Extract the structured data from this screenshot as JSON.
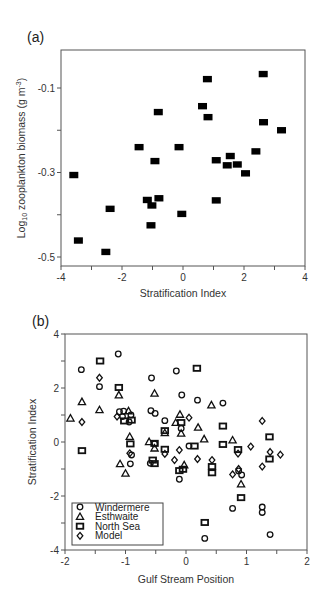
{
  "figure": {
    "panels": [
      "(a)",
      "(b)"
    ]
  },
  "chart_data": [
    {
      "panel_label": "(a)",
      "type": "scatter",
      "title": "",
      "xlabel": "Stratification Index",
      "ylabel": "Log10 zooplankton biomass (g m-3)",
      "ylabel_parts": {
        "main": "Log",
        "sub": "10",
        "rest": " zooplankton biomass (g m",
        "sup": "-3",
        "end": ")"
      },
      "xlim": [
        -4,
        4
      ],
      "ylim": [
        -0.54,
        -0.01
      ],
      "xticks": [
        -4,
        -3,
        -2,
        -1,
        0,
        1,
        2,
        3,
        4
      ],
      "xtick_labels": [
        "-4",
        "",
        "-2",
        "",
        "0",
        "",
        "2",
        "",
        "4"
      ],
      "yticks": [
        -0.5,
        -0.4,
        -0.3,
        -0.2,
        -0.1
      ],
      "ytick_labels": [
        "-0.5",
        "",
        "-0.3",
        "",
        "-0.1"
      ],
      "grid": false,
      "legend": null,
      "series": [
        {
          "name": "Zooplankton biomass",
          "marker": "filled-square",
          "color": "#000000",
          "points": [
            [
              -3.58,
              -0.306
            ],
            [
              -3.43,
              -0.461
            ],
            [
              -2.53,
              -0.488
            ],
            [
              -2.39,
              -0.386
            ],
            [
              -1.44,
              -0.24
            ],
            [
              -0.81,
              -0.157
            ],
            [
              -0.92,
              -0.273
            ],
            [
              -0.13,
              -0.24
            ],
            [
              -1.17,
              -0.365
            ],
            [
              -0.79,
              -0.361
            ],
            [
              -1.02,
              -0.378
            ],
            [
              -1.05,
              -0.425
            ],
            [
              -0.04,
              -0.398
            ],
            [
              0.8,
              -0.079
            ],
            [
              2.63,
              -0.067
            ],
            [
              0.64,
              -0.143
            ],
            [
              0.82,
              -0.169
            ],
            [
              2.64,
              -0.181
            ],
            [
              3.23,
              -0.2
            ],
            [
              2.39,
              -0.25
            ],
            [
              1.09,
              -0.271
            ],
            [
              1.55,
              -0.261
            ],
            [
              1.45,
              -0.283
            ],
            [
              1.78,
              -0.281
            ],
            [
              2.05,
              -0.302
            ],
            [
              1.09,
              -0.366
            ]
          ]
        }
      ]
    },
    {
      "panel_label": "(b)",
      "type": "scatter",
      "title": "",
      "xlabel": "Gulf Stream Position",
      "ylabel": "Stratification Index",
      "xlim": [
        -2,
        2
      ],
      "ylim": [
        -4,
        4
      ],
      "xticks": [
        -2,
        -1.5,
        -1,
        -0.5,
        0,
        0.5,
        1,
        1.5,
        2
      ],
      "xtick_labels": [
        "-2",
        "",
        "-1",
        "",
        "0",
        "",
        "1",
        "",
        "2"
      ],
      "yticks": [
        -4,
        -3,
        -2,
        -1,
        0,
        1,
        2,
        3,
        4
      ],
      "ytick_labels": [
        "-4",
        "",
        "-2",
        "",
        "0",
        "",
        "2",
        "",
        "4"
      ],
      "grid": false,
      "legend": {
        "position": "lower left",
        "entries": [
          "Windermere",
          "Esthwaite",
          "North Sea",
          "Model"
        ]
      },
      "series": [
        {
          "name": "Windermere",
          "marker": "circle",
          "points": [
            [
              -1.73,
              2.68
            ],
            [
              -1.12,
              3.26
            ],
            [
              -1.43,
              2.05
            ],
            [
              -0.57,
              2.37
            ],
            [
              -0.16,
              2.63
            ],
            [
              -0.07,
              1.74
            ],
            [
              0.19,
              1.55
            ],
            [
              0.61,
              1.44
            ],
            [
              -1.1,
              1.12
            ],
            [
              -1.03,
              1.14
            ],
            [
              -1.05,
              0.94
            ],
            [
              -0.91,
              1.0
            ],
            [
              -0.94,
              0.74
            ],
            [
              -0.51,
              1.06
            ],
            [
              -0.58,
              1.16
            ],
            [
              -0.35,
              0.79
            ],
            [
              -0.08,
              0.5
            ],
            [
              -0.92,
              -0.81
            ],
            [
              -0.59,
              -0.79
            ],
            [
              -0.52,
              -0.07
            ],
            [
              -0.11,
              -1.38
            ],
            [
              0.05,
              -0.15
            ],
            [
              0.77,
              -2.46
            ],
            [
              1.26,
              -2.41
            ],
            [
              1.26,
              -2.61
            ],
            [
              0.31,
              -3.57
            ],
            [
              1.39,
              -3.43
            ],
            [
              0.87,
              -1.07
            ],
            [
              0.92,
              -1.22
            ],
            [
              -0.9,
              -0.48
            ]
          ]
        },
        {
          "name": "Esthwaite",
          "marker": "triangle",
          "points": [
            [
              -1.91,
              0.88
            ],
            [
              -1.72,
              1.49
            ],
            [
              -1.43,
              1.19
            ],
            [
              -1.11,
              1.74
            ],
            [
              -0.95,
              1.15
            ],
            [
              -0.52,
              1.8
            ],
            [
              -0.1,
              1.02
            ],
            [
              -0.17,
              0.72
            ],
            [
              -0.35,
              0.34
            ],
            [
              -0.08,
              0.32
            ],
            [
              -0.93,
              0.2
            ],
            [
              -0.61,
              0.01
            ],
            [
              -0.52,
              -0.23
            ],
            [
              -1.09,
              -0.81
            ],
            [
              -1.0,
              -1.16
            ],
            [
              -0.03,
              -0.85
            ],
            [
              0.2,
              0.54
            ],
            [
              0.3,
              0.11
            ],
            [
              0.42,
              1.37
            ],
            [
              0.77,
              0.07
            ],
            [
              0.91,
              -1.56
            ]
          ]
        },
        {
          "name": "North Sea",
          "marker": "square",
          "points": [
            [
              -1.42,
              3.0
            ],
            [
              -1.11,
              2.02
            ],
            [
              -1.02,
              0.78
            ],
            [
              -0.9,
              0.81
            ],
            [
              -0.92,
              -0.07
            ],
            [
              -1.72,
              -0.32
            ],
            [
              -0.52,
              -0.05
            ],
            [
              -0.35,
              0.42
            ],
            [
              -0.35,
              -0.27
            ],
            [
              -0.08,
              0.72
            ],
            [
              -0.55,
              -0.67
            ],
            [
              -0.52,
              -0.8
            ],
            [
              -0.11,
              -1.06
            ],
            [
              -0.05,
              -1.01
            ],
            [
              0.14,
              -0.15
            ],
            [
              0.18,
              2.73
            ],
            [
              0.61,
              0.59
            ],
            [
              0.61,
              -0.09
            ],
            [
              0.86,
              -0.28
            ],
            [
              0.43,
              -0.91
            ],
            [
              0.43,
              -1.14
            ],
            [
              1.38,
              0.19
            ],
            [
              1.38,
              -0.63
            ],
            [
              0.31,
              -2.98
            ],
            [
              0.91,
              -2.06
            ]
          ]
        },
        {
          "name": "Model",
          "marker": "diamond",
          "points": [
            [
              -1.43,
              2.38
            ],
            [
              -1.72,
              0.74
            ],
            [
              -1.14,
              0.94
            ],
            [
              -0.93,
              -0.42
            ],
            [
              0.05,
              0.9
            ],
            [
              -0.35,
              -0.44
            ],
            [
              -0.11,
              -0.3
            ],
            [
              -0.19,
              -0.67
            ],
            [
              0.19,
              -0.63
            ],
            [
              0.43,
              -0.67
            ],
            [
              0.86,
              -0.43
            ],
            [
              1.07,
              -0.17
            ],
            [
              1.26,
              0.78
            ],
            [
              1.39,
              -0.37
            ],
            [
              1.56,
              -0.47
            ],
            [
              1.26,
              -0.91
            ],
            [
              0.77,
              -1.2
            ],
            [
              0.87,
              -1.0
            ]
          ]
        }
      ]
    }
  ],
  "layout": {
    "panel_a": {
      "left": 61,
      "top": 50,
      "right": 305,
      "bottom": 266
    },
    "panel_b": {
      "left": 65,
      "top": 334,
      "right": 307,
      "bottom": 550
    }
  }
}
